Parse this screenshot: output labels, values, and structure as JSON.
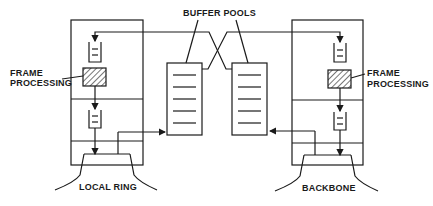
{
  "diagram": {
    "labels": {
      "buffer_pools": "BUFFER POOLS",
      "left_frame_processing_1": "FRAME",
      "left_frame_processing_2": "PROCESSING",
      "right_frame_processing_1": "FRAME",
      "right_frame_processing_2": "PROCESSING",
      "local_ring": "LOCAL RING",
      "backbone": "BACKBONE"
    },
    "nodes": [
      {
        "id": "left-bridge-port",
        "network": "LOCAL RING"
      },
      {
        "id": "right-bridge-port",
        "network": "BACKBONE"
      },
      {
        "id": "left-buffer-pool",
        "entries": 5
      },
      {
        "id": "right-buffer-pool",
        "entries": 5
      }
    ],
    "colors": {
      "ink": "#1a1a1a",
      "background": "#ffffff"
    }
  }
}
